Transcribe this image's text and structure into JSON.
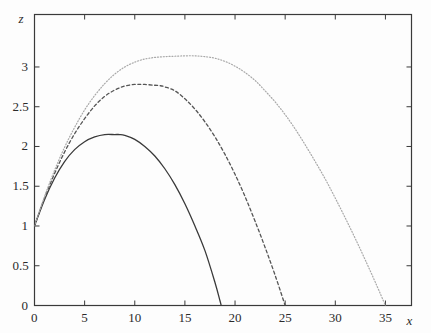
{
  "chart_data": {
    "type": "line",
    "title": "",
    "xlabel": "x",
    "ylabel": "z",
    "xlim": [
      0,
      37.6
    ],
    "ylim": [
      0,
      3.66
    ],
    "grid": false,
    "legend": "none",
    "background_color": "#fdfdfd",
    "frame_color": "#3a3a3a",
    "xticks": [
      {
        "value": 0,
        "label": "0"
      },
      {
        "value": 5,
        "label": "5"
      },
      {
        "value": 10,
        "label": "10"
      },
      {
        "value": 15,
        "label": "15"
      },
      {
        "value": 20,
        "label": "20"
      },
      {
        "value": 25,
        "label": "25"
      },
      {
        "value": 30,
        "label": "30"
      },
      {
        "value": 35,
        "label": "35"
      }
    ],
    "yticks": [
      {
        "value": 0,
        "label": "0"
      },
      {
        "value": 0.5,
        "label": "0.5"
      },
      {
        "value": 1,
        "label": "1"
      },
      {
        "value": 1.5,
        "label": "1.5"
      },
      {
        "value": 2,
        "label": "2"
      },
      {
        "value": 2.5,
        "label": "2.5"
      },
      {
        "value": 3,
        "label": "3"
      }
    ],
    "series": [
      {
        "name": "curve-solid",
        "style": "solid",
        "color": "#3a3a3a",
        "width": 1.3,
        "dash": "",
        "start": [
          0,
          1.0
        ],
        "peak": [
          8.5,
          2.15
        ],
        "zero_crossing": 18.5,
        "points": [
          [
            0,
            1.0
          ],
          [
            1,
            1.33
          ],
          [
            2,
            1.6
          ],
          [
            3,
            1.81
          ],
          [
            4,
            1.96
          ],
          [
            5,
            2.06
          ],
          [
            6,
            2.12
          ],
          [
            7,
            2.15
          ],
          [
            8,
            2.15
          ],
          [
            8.5,
            2.15
          ],
          [
            9,
            2.14
          ],
          [
            10,
            2.09
          ],
          [
            11,
            2.0
          ],
          [
            12,
            1.88
          ],
          [
            13,
            1.72
          ],
          [
            14,
            1.52
          ],
          [
            15,
            1.28
          ],
          [
            16,
            1.0
          ],
          [
            17,
            0.69
          ],
          [
            18,
            0.29
          ],
          [
            18.5,
            0.06
          ],
          [
            18.62,
            0
          ]
        ]
      },
      {
        "name": "curve-dashed",
        "style": "dashed",
        "color": "#555555",
        "width": 1.3,
        "dash": "3,2.6",
        "start": [
          0,
          1.0
        ],
        "peak": [
          12.5,
          2.77
        ],
        "zero_crossing": 25.0,
        "points": [
          [
            0,
            1.0
          ],
          [
            1,
            1.35
          ],
          [
            2,
            1.66
          ],
          [
            3,
            1.93
          ],
          [
            4,
            2.16
          ],
          [
            5,
            2.35
          ],
          [
            6,
            2.51
          ],
          [
            7,
            2.63
          ],
          [
            8,
            2.71
          ],
          [
            9,
            2.76
          ],
          [
            10,
            2.78
          ],
          [
            11,
            2.78
          ],
          [
            12,
            2.77
          ],
          [
            12.5,
            2.765
          ],
          [
            13,
            2.75
          ],
          [
            14,
            2.7
          ],
          [
            15,
            2.6
          ],
          [
            16,
            2.47
          ],
          [
            17,
            2.31
          ],
          [
            18,
            2.12
          ],
          [
            19,
            1.9
          ],
          [
            20,
            1.65
          ],
          [
            21,
            1.37
          ],
          [
            22,
            1.06
          ],
          [
            23,
            0.73
          ],
          [
            24,
            0.38
          ],
          [
            25,
            0
          ]
        ]
      },
      {
        "name": "curve-dotted",
        "style": "dotted",
        "color": "#a8a8a8",
        "width": 1.2,
        "dash": "1,1.9",
        "start": [
          0,
          1.0
        ],
        "peak": [
          17.0,
          3.13
        ],
        "zero_crossing": 35.0,
        "points": [
          [
            0,
            1.0
          ],
          [
            1,
            1.37
          ],
          [
            2,
            1.7
          ],
          [
            3,
            1.99
          ],
          [
            4,
            2.24
          ],
          [
            5,
            2.46
          ],
          [
            6,
            2.64
          ],
          [
            7,
            2.79
          ],
          [
            8,
            2.91
          ],
          [
            9,
            3.0
          ],
          [
            10,
            3.06
          ],
          [
            11,
            3.1
          ],
          [
            12,
            3.12
          ],
          [
            13,
            3.13
          ],
          [
            14,
            3.135
          ],
          [
            15,
            3.14
          ],
          [
            16,
            3.14
          ],
          [
            17,
            3.13
          ],
          [
            18,
            3.11
          ],
          [
            19,
            3.07
          ],
          [
            20,
            3.01
          ],
          [
            21,
            2.93
          ],
          [
            22,
            2.83
          ],
          [
            23,
            2.7
          ],
          [
            24,
            2.56
          ],
          [
            25,
            2.4
          ],
          [
            26,
            2.22
          ],
          [
            27,
            2.02
          ],
          [
            28,
            1.81
          ],
          [
            29,
            1.59
          ],
          [
            30,
            1.35
          ],
          [
            31,
            1.1
          ],
          [
            32,
            0.84
          ],
          [
            33,
            0.57
          ],
          [
            34,
            0.29
          ],
          [
            35,
            0
          ]
        ]
      }
    ]
  }
}
